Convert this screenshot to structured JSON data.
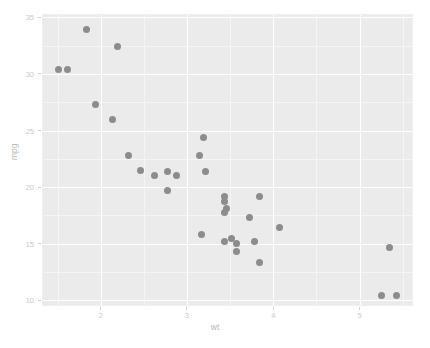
{
  "chart_data": {
    "type": "scatter",
    "title": "",
    "subtitle": "",
    "xlabel": "wt",
    "ylabel": "mpg",
    "xlim": [
      1.32,
      5.62
    ],
    "ylim": [
      9.5,
      35.3
    ],
    "xticks": [
      2,
      3,
      4,
      5
    ],
    "xtick_labels": [
      "2",
      "3",
      "4",
      "5"
    ],
    "yticks": [
      10,
      15,
      20,
      25,
      30,
      35
    ],
    "ytick_labels": [
      "10",
      "15",
      "20",
      "25",
      "30",
      "35"
    ],
    "x_minor_ticks": [
      1.5,
      2.5,
      3.5,
      4.5,
      5.5
    ],
    "y_minor_ticks": [
      12.5,
      17.5,
      22.5,
      27.5,
      32.5
    ],
    "grid": true,
    "legend": "none",
    "point_color": "#8c8c8c",
    "panel_background": "#ebebeb",
    "gridline_color": "#ffffff",
    "axis_text_color": "#c9c9c9",
    "axis_title_color": "#b9b9b9",
    "series": [
      {
        "name": "mtcars",
        "x": [
          2.62,
          2.875,
          2.32,
          3.215,
          3.44,
          3.46,
          3.57,
          3.19,
          3.15,
          3.44,
          3.44,
          4.07,
          3.73,
          3.78,
          5.25,
          5.424,
          5.345,
          2.2,
          1.615,
          1.835,
          2.465,
          3.52,
          3.435,
          3.84,
          3.845,
          1.935,
          2.14,
          1.513,
          3.17,
          2.77,
          3.57,
          2.78
        ],
        "y": [
          21.0,
          21.0,
          22.8,
          21.4,
          18.7,
          18.1,
          14.3,
          24.4,
          22.8,
          19.2,
          17.8,
          16.4,
          17.3,
          15.2,
          10.4,
          10.4,
          14.7,
          32.4,
          30.4,
          33.9,
          21.5,
          15.5,
          15.2,
          13.3,
          19.2,
          27.3,
          26.0,
          30.4,
          15.8,
          19.7,
          15.0,
          21.4
        ]
      }
    ]
  },
  "figure": {
    "background": "#ffffff",
    "width": 430,
    "height": 348
  }
}
